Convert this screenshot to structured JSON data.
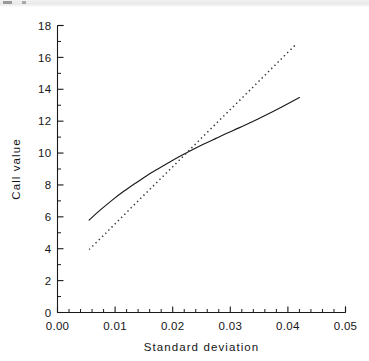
{
  "chart_data": {
    "type": "line",
    "title": "",
    "subtitle": "",
    "xlabel": "Standard deviation",
    "ylabel": "Call value",
    "xlim": [
      0.0,
      0.05
    ],
    "ylim": [
      0,
      18
    ],
    "grid": false,
    "legend": null,
    "x_ticks": [
      0.0,
      0.01,
      0.02,
      0.03,
      0.04,
      0.05
    ],
    "x_tick_labels": [
      "0.00",
      "0.01",
      "0.02",
      "0.03",
      "0.04",
      "0.05"
    ],
    "x_minor_step": 0.002,
    "y_ticks": [
      0,
      2,
      4,
      6,
      8,
      10,
      12,
      14,
      16,
      18
    ],
    "y_tick_labels": [
      "0",
      "2",
      "4",
      "6",
      "8",
      "10",
      "12",
      "14",
      "16",
      "18"
    ],
    "y_minor_step": 1,
    "annotations": [],
    "series": [
      {
        "name": "solid-curve",
        "style": "solid",
        "color": "#1a1a1a",
        "x": [
          0.0055,
          0.0075,
          0.0095,
          0.0115,
          0.0135,
          0.0155,
          0.0175,
          0.0195,
          0.0215,
          0.0235,
          0.0255,
          0.0275,
          0.0295,
          0.0315,
          0.0335,
          0.0355,
          0.0375,
          0.0395,
          0.042
        ],
        "values": [
          5.8,
          6.45,
          7.05,
          7.6,
          8.1,
          8.58,
          9.02,
          9.44,
          9.84,
          10.22,
          10.58,
          10.92,
          11.26,
          11.58,
          11.92,
          12.26,
          12.62,
          13.0,
          13.48
        ]
      },
      {
        "name": "dotted-line",
        "style": "dotted",
        "color": "#3a3a3a",
        "x": [
          0.0055,
          0.0085,
          0.0115,
          0.0145,
          0.0175,
          0.0205,
          0.0235,
          0.0265,
          0.0295,
          0.0325,
          0.0355,
          0.0385,
          0.0415
        ],
        "values": [
          3.95,
          5.02,
          6.1,
          7.18,
          8.25,
          9.32,
          10.4,
          11.48,
          12.55,
          13.62,
          14.7,
          15.78,
          16.85
        ]
      }
    ],
    "intersection": {
      "x": 0.0222,
      "y": 9.95
    }
  }
}
